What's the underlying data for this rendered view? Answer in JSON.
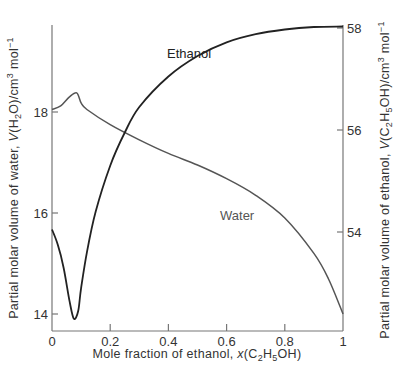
{
  "chart_data": {
    "type": "line",
    "title": "",
    "xlabel": "Mole fraction of ethanol, x(C2H5OH)",
    "xlabel_parts": {
      "pre": "Mole fraction of ethanol, ",
      "var": "x",
      "open": "(C",
      "sub1": "2",
      "mid": "H",
      "sub2": "5",
      "post": "OH)"
    },
    "ylabel_left": "Partial molar volume of water, V(H2O)/cm3 mol-1",
    "ylabel_left_parts": {
      "pre": "Partial molar volume of water, ",
      "var": "V",
      "open": "(H",
      "sub1": "2",
      "mid": "O)/cm",
      "sup1": "3",
      "unit": " mol",
      "sup2": "−1"
    },
    "ylabel_right": "Partial molar volume of ethanol, V(C2H5OH)/cm3 mol-1",
    "ylabel_right_parts": {
      "pre": "Partial molar volume of ethanol, ",
      "var": "V",
      "open": "(C",
      "sub1": "2",
      "mid": "H",
      "sub2": "5",
      "mid2": "OH)/cm",
      "sup1": "3",
      "unit": " mol",
      "sup2": "−1"
    },
    "xlim": [
      0,
      1
    ],
    "ylim_left": [
      13.6,
      18.4
    ],
    "ylim_right": [
      52.0,
      58.0
    ],
    "x_ticks": [
      "0",
      "0.2",
      "0.4",
      "0.6",
      "0.8",
      "1"
    ],
    "y_ticks_left": [
      "14",
      "16",
      "18"
    ],
    "y_ticks_right": [
      "54",
      "56",
      "58"
    ],
    "grid": false,
    "legend": "inline labels",
    "series": [
      {
        "name": "Water",
        "axis": "left",
        "color": "#555555",
        "x": [
          0.0,
          0.03,
          0.06,
          0.085,
          0.1,
          0.12,
          0.2,
          0.3,
          0.4,
          0.5,
          0.6,
          0.7,
          0.8,
          0.9,
          0.95,
          1.0
        ],
        "values": [
          18.05,
          18.12,
          18.3,
          18.38,
          18.18,
          18.05,
          17.75,
          17.45,
          17.18,
          16.95,
          16.68,
          16.35,
          15.9,
          15.2,
          14.7,
          14.0
        ]
      },
      {
        "name": "Ethanol",
        "axis": "right",
        "color": "#222222",
        "x": [
          0.0,
          0.02,
          0.04,
          0.06,
          0.075,
          0.09,
          0.1,
          0.12,
          0.15,
          0.2,
          0.25,
          0.3,
          0.4,
          0.5,
          0.6,
          0.7,
          0.8,
          0.9,
          1.0
        ],
        "values": [
          54.05,
          53.75,
          53.3,
          52.65,
          52.3,
          52.45,
          52.9,
          53.6,
          54.4,
          55.3,
          55.95,
          56.45,
          57.05,
          57.45,
          57.72,
          57.88,
          57.97,
          58.02,
          58.03
        ]
      }
    ],
    "annotations": [
      {
        "text": "Ethanol",
        "x": 0.2,
        "y_right": 57.5
      },
      {
        "text": "Water",
        "x": 0.62,
        "y_left": 16.2
      }
    ]
  }
}
